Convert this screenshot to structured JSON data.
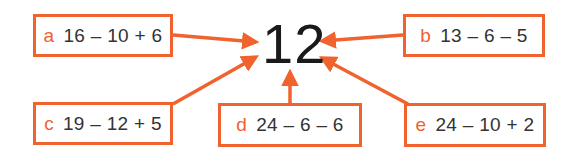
{
  "target_value": "12",
  "accent_color": "#f0622e",
  "options": [
    {
      "letter": "a",
      "expression": "16 – 10 + 6"
    },
    {
      "letter": "b",
      "expression": "13 – 6 – 5"
    },
    {
      "letter": "c",
      "expression": "19 – 12 + 5"
    },
    {
      "letter": "d",
      "expression": "24 – 6 – 6"
    },
    {
      "letter": "e",
      "expression": "24 – 10 + 2"
    }
  ]
}
